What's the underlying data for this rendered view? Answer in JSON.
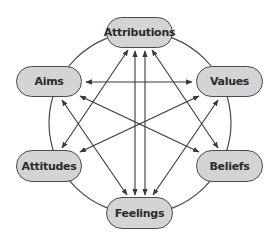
{
  "diagram": {
    "type": "circular-network",
    "nodes": [
      {
        "id": "attributions",
        "label": "Attributions"
      },
      {
        "id": "aims",
        "label": "Aims"
      },
      {
        "id": "values",
        "label": "Values"
      },
      {
        "id": "attitudes",
        "label": "Attitudes"
      },
      {
        "id": "beliefs",
        "label": "Beliefs"
      },
      {
        "id": "feelings",
        "label": "Feelings"
      }
    ],
    "edges": [
      {
        "from": "aims",
        "to": "values",
        "bidirectional": true
      },
      {
        "from": "aims",
        "to": "beliefs",
        "bidirectional": true
      },
      {
        "from": "attitudes",
        "to": "values",
        "bidirectional": true
      },
      {
        "from": "attributions",
        "to": "feelings",
        "bidirectional": true
      },
      {
        "from": "attributions",
        "to": "attitudes",
        "bidirectional": true
      },
      {
        "from": "attributions",
        "to": "beliefs",
        "bidirectional": true
      },
      {
        "from": "feelings",
        "to": "aims",
        "bidirectional": true
      },
      {
        "from": "feelings",
        "to": "values",
        "bidirectional": true
      }
    ],
    "colors": {
      "node_fill": "#d4d4d4",
      "stroke": "#4a4a4a",
      "text": "#2b2b2b"
    }
  }
}
